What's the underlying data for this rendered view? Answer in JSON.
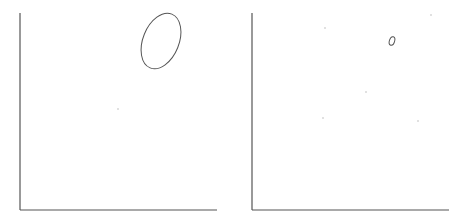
{
  "figure": {
    "panels": [
      {
        "id": "left",
        "axes": {
          "x_axis": {
            "x1": 20,
            "x2": 217,
            "y": 210
          },
          "y_axis": {
            "x": 20,
            "y1": 13,
            "y2": 210
          }
        },
        "ellipse": {
          "cx": 161,
          "cy": 41,
          "rx": 18,
          "ry": 29,
          "rotate": 22
        },
        "dots": [
          {
            "x": 118,
            "y": 109
          }
        ]
      },
      {
        "id": "right",
        "axes": {
          "x_axis": {
            "x1": 252,
            "x2": 449,
            "y": 210
          },
          "y_axis": {
            "x": 252,
            "y1": 13,
            "y2": 210
          }
        },
        "ellipse": {
          "cx": 392,
          "cy": 41,
          "rx": 2.6,
          "ry": 4.4,
          "rotate": 18
        },
        "dots": [
          {
            "x": 325,
            "y": 28
          },
          {
            "x": 366,
            "y": 92
          },
          {
            "x": 323,
            "y": 118
          },
          {
            "x": 418,
            "y": 121
          },
          {
            "x": 431,
            "y": 15
          }
        ]
      }
    ],
    "colors": {
      "line": "#555555",
      "dot": "#bbbbbb"
    }
  }
}
